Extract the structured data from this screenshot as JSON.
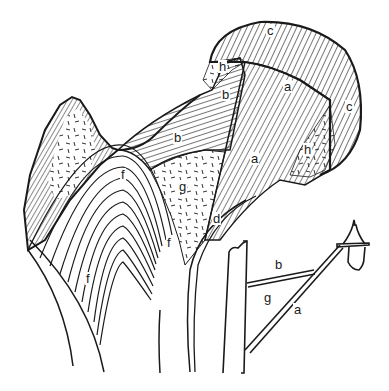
{
  "figure": {
    "line_color": "#1a1a1a",
    "background": "#ffffff"
  },
  "labels": {
    "femur": [
      {
        "id": "c_top",
        "text": "c",
        "x": 266,
        "y": 31
      },
      {
        "id": "h_upper",
        "text": "h",
        "x": 218,
        "y": 66
      },
      {
        "id": "a_upper",
        "text": "a",
        "x": 283,
        "y": 86
      },
      {
        "id": "b_upper",
        "text": "b",
        "x": 221,
        "y": 91
      },
      {
        "id": "c_right",
        "text": "c",
        "x": 345,
        "y": 102
      },
      {
        "id": "b_left",
        "text": "b",
        "x": 173,
        "y": 132
      },
      {
        "id": "h_right",
        "text": "h",
        "x": 303,
        "y": 144
      },
      {
        "id": "a_middle",
        "text": "a",
        "x": 250,
        "y": 154
      },
      {
        "id": "f_top",
        "text": "f",
        "x": 120,
        "y": 166
      },
      {
        "id": "g_middle",
        "text": "g",
        "x": 177,
        "y": 180
      },
      {
        "id": "d_neck",
        "text": "d",
        "x": 210,
        "y": 212
      },
      {
        "id": "f_right",
        "text": "f",
        "x": 166,
        "y": 238
      },
      {
        "id": "f_left",
        "text": "f",
        "x": 85,
        "y": 272
      }
    ],
    "lamp": [
      {
        "id": "lamp_b",
        "text": "b",
        "x": 274,
        "y": 264
      },
      {
        "id": "lamp_g",
        "text": "g",
        "x": 262,
        "y": 293
      },
      {
        "id": "lamp_a",
        "text": "a",
        "x": 293,
        "y": 305
      }
    ]
  }
}
